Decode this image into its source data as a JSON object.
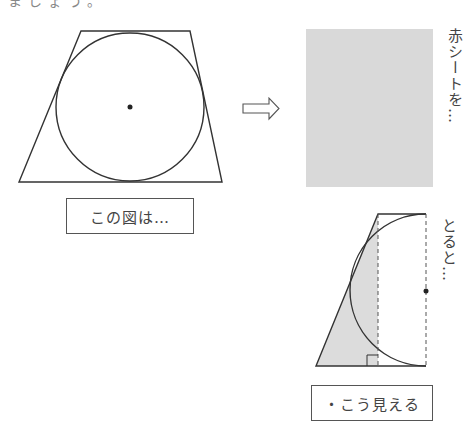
{
  "figure": {
    "cropped_top_text": "ましょう。",
    "left_caption": "この図は…",
    "vertical_text_1": "赤シートを…",
    "vertical_text_2": "とると…",
    "bottom_caption": "・こう見える"
  },
  "colors": {
    "stroke": "#333333",
    "sheet_gray": "#d9d9d9",
    "shade_gray": "#dcdcdc"
  }
}
